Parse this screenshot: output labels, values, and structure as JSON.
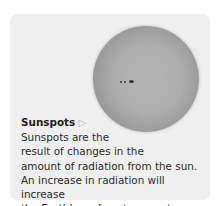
{
  "figure": {
    "title": "Sunspots",
    "arrow_icon": "▷",
    "lines": [
      "Sunspots are the",
      "result of changes in the",
      "amount of radiation from the sun.",
      "An increase in radiation will increase",
      "the Earth’s surface temperature."
    ],
    "image": "sun-with-sunspots",
    "colors": {
      "panel": "#efefef",
      "sun": "#adadad"
    }
  }
}
